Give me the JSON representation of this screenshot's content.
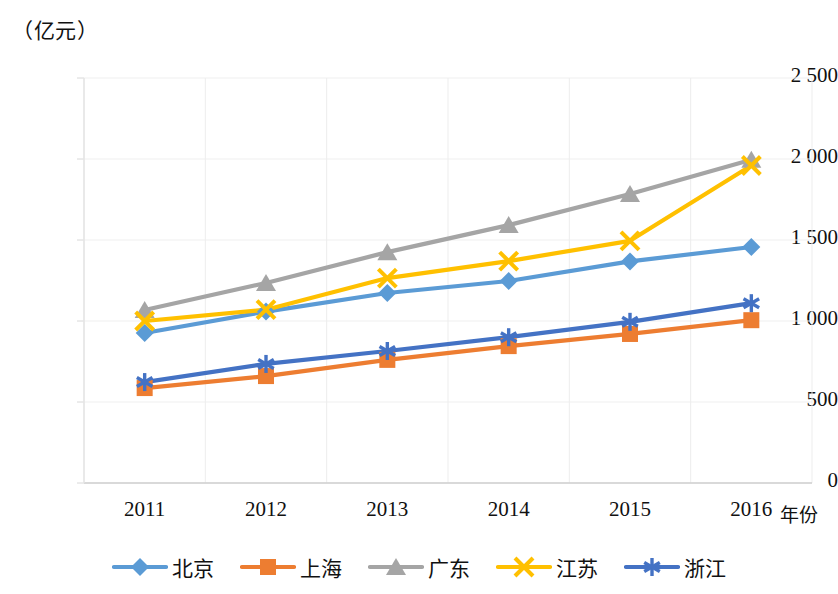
{
  "chart_data": {
    "type": "line",
    "title": "",
    "ylabel": "（亿元）",
    "xlabel": "年份",
    "categories": [
      "2011",
      "2012",
      "2013",
      "2014",
      "2015",
      "2016"
    ],
    "ylim": [
      0,
      2500
    ],
    "yticks": [
      "0",
      "500",
      "1 000",
      "1 500",
      "2 000",
      "2 500"
    ],
    "ytick_values": [
      0,
      500,
      1000,
      1500,
      2000,
      2500
    ],
    "grid": true,
    "legend_position": "bottom",
    "series": [
      {
        "name": "北京",
        "color": "#5B9BD5",
        "marker": "diamond",
        "values": [
          926,
          1058,
          1173,
          1247,
          1368,
          1457
        ]
      },
      {
        "name": "上海",
        "color": "#ED7D31",
        "marker": "square",
        "values": [
          586,
          660,
          760,
          845,
          920,
          1005
        ]
      },
      {
        "name": "广东",
        "color": "#A5A5A5",
        "marker": "triangle",
        "values": [
          1068,
          1235,
          1425,
          1592,
          1784,
          1995
        ]
      },
      {
        "name": "江苏",
        "color": "#FFC000",
        "marker": "cross",
        "values": [
          1000,
          1070,
          1265,
          1370,
          1495,
          1960
        ]
      },
      {
        "name": "浙江",
        "color": "#4472C4",
        "marker": "asterisk",
        "values": [
          623,
          735,
          815,
          900,
          995,
          1110
        ]
      }
    ]
  },
  "axes": {
    "unit_label": "（亿元）",
    "x_title": "年份"
  }
}
